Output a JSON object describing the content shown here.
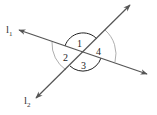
{
  "diagram": {
    "lines": [
      {
        "name": "l1",
        "label": "l",
        "subscript": "1"
      },
      {
        "name": "l2",
        "label": "l",
        "subscript": "2"
      }
    ],
    "angles": [
      {
        "label": "1",
        "style": "dark arc"
      },
      {
        "label": "2",
        "style": "light arc"
      },
      {
        "label": "3",
        "style": "dark arc"
      },
      {
        "label": "4",
        "style": "light arc"
      }
    ],
    "colors": {
      "line": "#555555",
      "dark_arc": "#222222",
      "light_arc": "#888888"
    }
  }
}
